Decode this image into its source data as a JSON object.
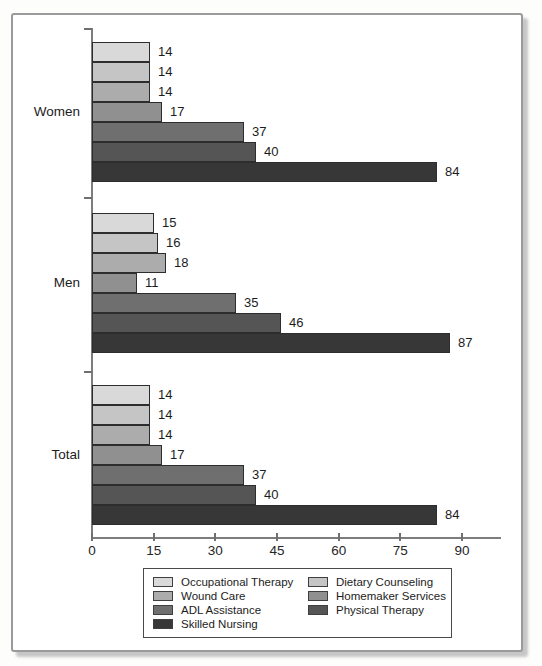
{
  "chart_data": {
    "type": "bar",
    "orientation": "horizontal",
    "title": "",
    "xlabel": "",
    "ylabel": "",
    "categories": [
      "Women",
      "Men",
      "Total"
    ],
    "series": [
      {
        "name": "Occupational Therapy",
        "color": "#d9d9d9",
        "values": [
          14,
          15,
          14
        ]
      },
      {
        "name": "Dietary Counseling",
        "color": "#c5c5c5",
        "values": [
          14,
          16,
          14
        ]
      },
      {
        "name": "Wound Care",
        "color": "#acacac",
        "values": [
          14,
          18,
          14
        ]
      },
      {
        "name": "Homemaker Services",
        "color": "#909090",
        "values": [
          17,
          11,
          17
        ]
      },
      {
        "name": "ADL Assistance",
        "color": "#6f6f6f",
        "values": [
          37,
          35,
          37
        ]
      },
      {
        "name": "Physical Therapy",
        "color": "#555555",
        "values": [
          40,
          46,
          40
        ]
      },
      {
        "name": "Skilled Nursing",
        "color": "#373737",
        "values": [
          84,
          87,
          84
        ]
      }
    ],
    "xlim": [
      0,
      90
    ],
    "xticks": [
      0,
      15,
      30,
      45,
      60,
      75,
      90
    ],
    "bar_value_labels": true,
    "grid": false,
    "legend_position": "bottom",
    "legend_columns": 2
  }
}
